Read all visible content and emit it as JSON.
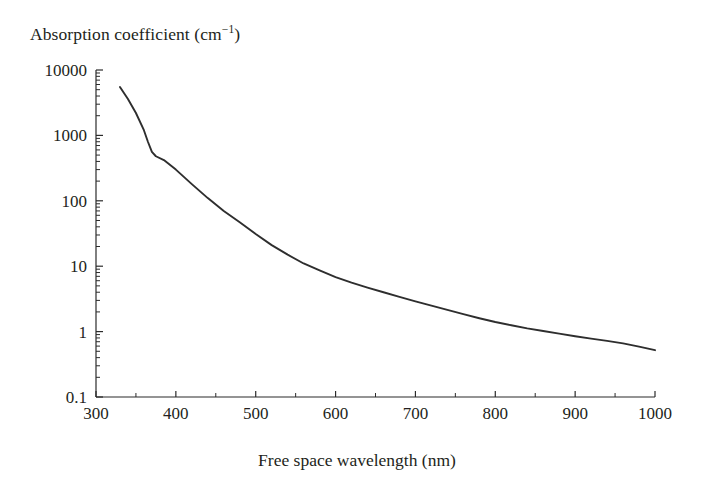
{
  "chart_data": {
    "type": "line",
    "title": "Absorption coefficient (cm−1)",
    "title_base": "Absorption coefficient (cm",
    "title_sup": "−1",
    "title_close": ")",
    "xlabel": "Free space wavelength (nm)",
    "ylabel": "Absorption coefficient (cm−1)",
    "xscale": "linear",
    "yscale": "log",
    "xlim": [
      300,
      1000
    ],
    "ylim": [
      0.1,
      10000
    ],
    "grid": false,
    "legend": null,
    "x_major_ticks": [
      300,
      400,
      500,
      600,
      700,
      800,
      900,
      1000
    ],
    "x_minor_ticks": [
      350,
      450,
      550,
      650,
      750,
      850,
      950
    ],
    "x_tick_labels": [
      "300",
      "400",
      "500",
      "600",
      "700",
      "800",
      "900",
      "1000"
    ],
    "y_major_ticks": [
      0.1,
      1,
      10,
      100,
      1000,
      10000
    ],
    "y_tick_labels": [
      "0.1",
      "1",
      "10",
      "100",
      "1000",
      "10000"
    ],
    "series": [
      {
        "name": "silicon absorption coefficient",
        "color": "#2e2e2e",
        "x": [
          330,
          340,
          350,
          360,
          365,
          370,
          375,
          385,
          400,
          420,
          440,
          460,
          480,
          500,
          520,
          540,
          560,
          580,
          600,
          620,
          640,
          660,
          680,
          700,
          720,
          740,
          760,
          780,
          800,
          820,
          840,
          860,
          880,
          900,
          920,
          940,
          960,
          980,
          1000
        ],
        "y": [
          5500,
          3600,
          2200,
          1200,
          800,
          560,
          480,
          420,
          300,
          180,
          110,
          70,
          47,
          31,
          21,
          15,
          11,
          8.6,
          6.8,
          5.6,
          4.7,
          4.0,
          3.4,
          2.9,
          2.5,
          2.15,
          1.85,
          1.6,
          1.4,
          1.25,
          1.12,
          1.02,
          0.93,
          0.85,
          0.78,
          0.72,
          0.66,
          0.59,
          0.52
        ]
      }
    ]
  },
  "axes": {
    "x_title": "Free space wavelength (nm)",
    "y_title": "Absorption coefficient (cm−1)"
  },
  "colors": {
    "curve": "#2e2e2e",
    "axis": "#2b2b2b",
    "text": "#231f20",
    "background": "#ffffff"
  }
}
